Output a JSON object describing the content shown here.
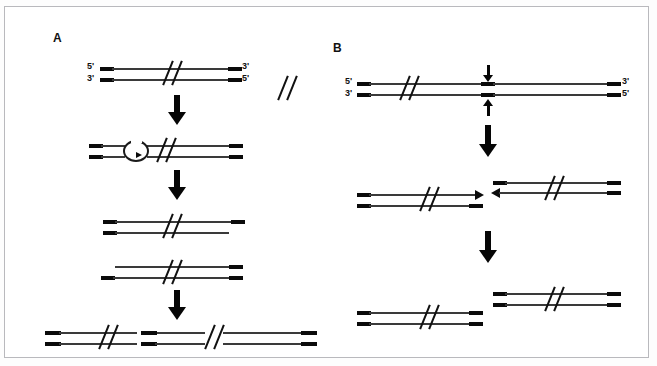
{
  "figure": {
    "panels": [
      {
        "id": "A",
        "label": "A",
        "label_x": 52,
        "label_y": 30,
        "caption": "Panel A: nicking, D-loop bubble formation, strand separation and joined product",
        "steps": [
          {
            "name": "duplex-with-ends-labeled",
            "end_labels": {
              "left_top": "5'",
              "left_bottom": "3'",
              "right_top": "3'",
              "right_bottom": "5'"
            }
          },
          {
            "name": "duplex-with-d-loop-bubble"
          },
          {
            "name": "duplex-short-bottom-strand"
          },
          {
            "name": "duplex-short-top-strand"
          },
          {
            "name": "ligated-long-product"
          }
        ]
      },
      {
        "id": "B",
        "label": "B",
        "label_x": 332,
        "label_y": 40,
        "caption": "Panel B: staggered double-strand cut and separation of the two fragments",
        "steps": [
          {
            "name": "duplex-with-cut-site-arrows",
            "end_labels": {
              "left_top": "5'",
              "left_bottom": "3'",
              "right_top": "3'",
              "right_bottom": "5'"
            }
          },
          {
            "name": "staggered-cut-fragments"
          },
          {
            "name": "separated-blunt-fragments"
          }
        ]
      }
    ],
    "colors": {
      "strand": "#3a3a3a",
      "cap": "#0b0b0b",
      "arrow": "#060606",
      "frame": "#b9b9bd",
      "background": "#ffffff",
      "text": "#111111"
    }
  }
}
